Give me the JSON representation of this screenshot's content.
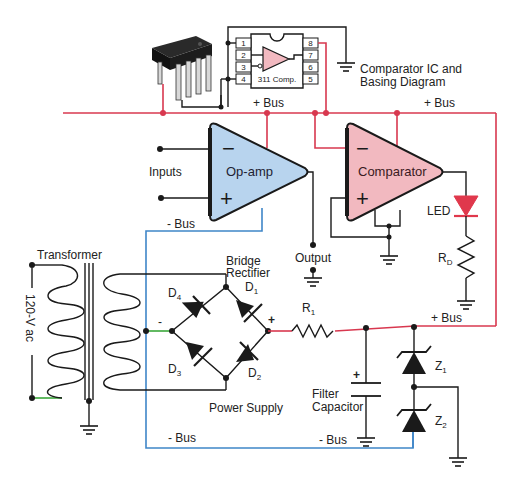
{
  "diagram": {
    "type": "electronic-schematic",
    "colors": {
      "plus_bus": "#d8384f",
      "minus_bus": "#3f86c8",
      "wire": "#1a1a1a",
      "opamp_fill": "#b8d4ee",
      "comparator_fill": "#f2b9c0",
      "led": "#e0384c",
      "ac_lead": "#3aa83a"
    },
    "ic": {
      "title_line1": "Comparator IC and",
      "title_line2": "Basing Diagram",
      "chip_label": "311 Comp.",
      "pins_left": [
        "1",
        "2",
        "3",
        "4"
      ],
      "pins_right": [
        "8",
        "7",
        "6",
        "5"
      ]
    },
    "buses": {
      "plus_top_left": "+ Bus",
      "plus_top_right": "+ Bus",
      "plus_mid": "+ Bus",
      "minus_opamp": "- Bus",
      "minus_bottom_left": "- Bus",
      "minus_bottom_right": "- Bus"
    },
    "opamp": {
      "label": "Op-amp",
      "inputs_label": "Inputs",
      "minus_sign": "−",
      "plus_sign": "+",
      "output_label": "Output"
    },
    "comparator": {
      "label": "Comparator",
      "minus_sign": "−",
      "plus_sign": "+",
      "led_label": "LED",
      "resistor_label": "R",
      "resistor_sub": "D"
    },
    "power_supply": {
      "title": "Power Supply",
      "transformer_label": "Transformer",
      "ac_label": "120-V ac",
      "bridge_line1": "Bridge",
      "bridge_line2": "Rectifier",
      "diodes": [
        {
          "name": "D",
          "sub": "1"
        },
        {
          "name": "D",
          "sub": "2"
        },
        {
          "name": "D",
          "sub": "3"
        },
        {
          "name": "D",
          "sub": "4"
        }
      ],
      "bridge_minus": "-",
      "bridge_plus": "+",
      "r1_label": "R",
      "r1_sub": "1",
      "cap_line1": "Filter",
      "cap_line2": "Capacitor",
      "cap_plus": "+",
      "zeners": [
        {
          "name": "Z",
          "sub": "1"
        },
        {
          "name": "Z",
          "sub": "2"
        }
      ]
    }
  }
}
